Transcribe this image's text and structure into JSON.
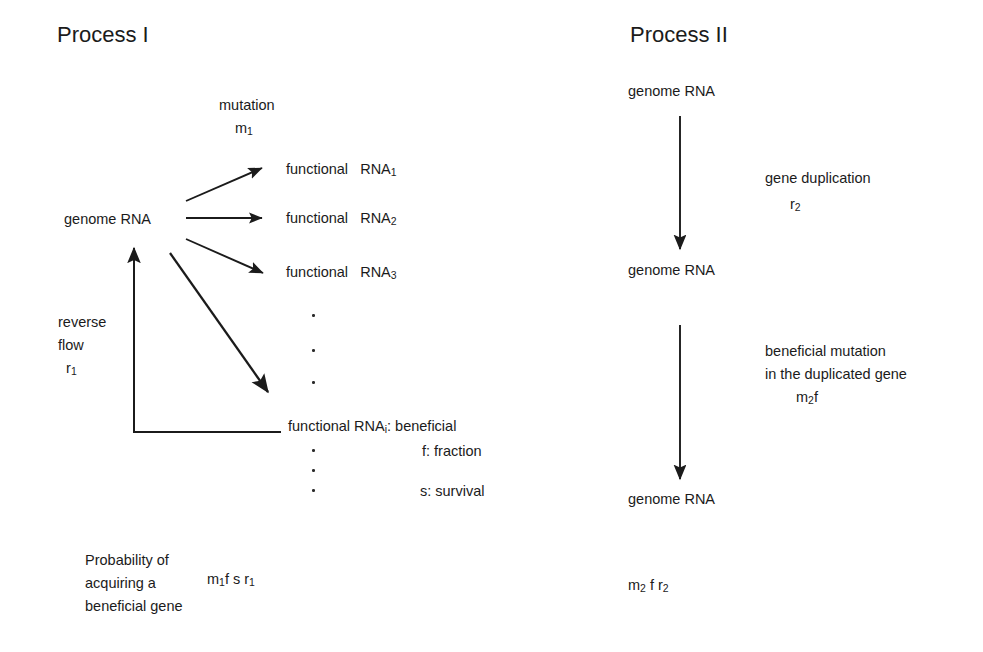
{
  "figure": {
    "kind": "flow-diagram",
    "background_color": "#ffffff",
    "line_color": "#1b1b1b",
    "text_color": "#1b1b1b"
  },
  "process_one": {
    "title": "Process I",
    "source_node": "genome RNA",
    "mutation_label": "mutation",
    "mutation_rate": "m",
    "mutation_rate_sub": "1",
    "products": [
      {
        "prefix": "functional",
        "name": "RNA",
        "index": "1"
      },
      {
        "prefix": "functional",
        "name": "RNA",
        "index": "2"
      },
      {
        "prefix": "functional",
        "name": "RNA",
        "index": "3"
      }
    ],
    "terminal_product": {
      "prefix": "functional RNA",
      "index": "i",
      "suffix": ": beneficial"
    },
    "definitions": [
      "f: fraction",
      "s: survival"
    ],
    "reverse_flow": {
      "line_one": "reverse",
      "line_two": "flow",
      "rate": "r",
      "rate_sub": "1"
    },
    "result": {
      "line_one": "Probability of",
      "line_two": "acquiring a",
      "line_three": "beneficial gene",
      "formula_parts": [
        {
          "base": "m",
          "sub": "1"
        },
        {
          "base": "f s r",
          "sub": ""
        },
        {
          "base": "",
          "sub": "1"
        }
      ],
      "formula_plain": "m1f s r1"
    },
    "vertical_dots_count": 3,
    "lower_dots_count": 3
  },
  "process_two": {
    "title": "Process II",
    "nodes": [
      "genome RNA",
      "genome RNA",
      "genome RNA"
    ],
    "step_one": {
      "label": "gene duplication",
      "rate": "r",
      "rate_sub": "2"
    },
    "step_two": {
      "line_one": "beneficial mutation",
      "line_two": "in the duplicated gene",
      "rate": "m",
      "rate_sub": "2",
      "rate_tail": "f"
    },
    "result": {
      "formula_plain": "m2 f r2",
      "base_one": "m",
      "sub_one": "2",
      "middle": " f r",
      "sub_two": "2"
    }
  }
}
